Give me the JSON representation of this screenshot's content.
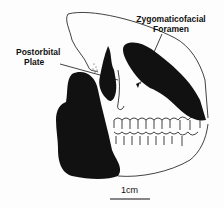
{
  "figure": {
    "labels": {
      "zygomaticofacial_line1": "Zygomaticofacial",
      "zygomaticofacial_line2": "Foramen",
      "postorbital_line1": "Postorbital",
      "postorbital_line2": "Plate"
    },
    "scale_bar": {
      "label": "1cm"
    },
    "colors": {
      "ink": "#111111",
      "background": "#fdfdfd"
    }
  }
}
